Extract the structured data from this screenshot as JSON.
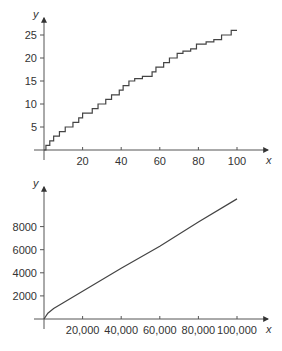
{
  "chart_data": [
    {
      "type": "line",
      "style": "step",
      "title": "",
      "xlabel": "x",
      "ylabel": "y",
      "xlim": [
        0,
        115
      ],
      "ylim": [
        0,
        28
      ],
      "x_ticks": [
        20,
        40,
        60,
        80,
        100
      ],
      "x_tick_labels": [
        "20",
        "40",
        "60",
        "80",
        "100"
      ],
      "y_ticks": [
        5,
        10,
        15,
        20,
        25
      ],
      "y_tick_labels": [
        "5",
        "10",
        "15",
        "20",
        "25"
      ],
      "grid": false,
      "legend": null,
      "series": [
        {
          "name": "step",
          "x": [
            0,
            1,
            3,
            5,
            8,
            11,
            15,
            18,
            20,
            25,
            28,
            32,
            35,
            39,
            41,
            44,
            47,
            51,
            56,
            58,
            62,
            65,
            69,
            72,
            76,
            79,
            84,
            88,
            92,
            97,
            100
          ],
          "y": [
            0,
            1,
            2,
            3,
            4,
            5,
            6,
            7,
            8,
            9,
            10,
            11,
            12,
            13,
            14,
            15,
            15.5,
            16,
            17,
            18,
            19,
            20,
            21,
            21.5,
            22,
            23,
            23.5,
            24,
            25,
            26,
            26
          ]
        }
      ]
    },
    {
      "type": "line",
      "title": "",
      "xlabel": "x",
      "ylabel": "y",
      "xlim": [
        0,
        115000
      ],
      "ylim": [
        0,
        11000
      ],
      "x_ticks": [
        20000,
        40000,
        60000,
        80000,
        100000
      ],
      "x_tick_labels": [
        "20,000",
        "40,000",
        "60,000",
        "80,000",
        "100,000"
      ],
      "y_ticks": [
        2000,
        4000,
        6000,
        8000
      ],
      "y_tick_labels": [
        "2000",
        "4000",
        "6000",
        "8000"
      ],
      "grid": false,
      "legend": null,
      "series": [
        {
          "name": "curve",
          "x": [
            0,
            2000,
            5000,
            10000,
            20000,
            40000,
            60000,
            80000,
            100000
          ],
          "y": [
            0,
            500,
            900,
            1400,
            2400,
            4400,
            6300,
            8400,
            10400
          ]
        }
      ]
    }
  ]
}
